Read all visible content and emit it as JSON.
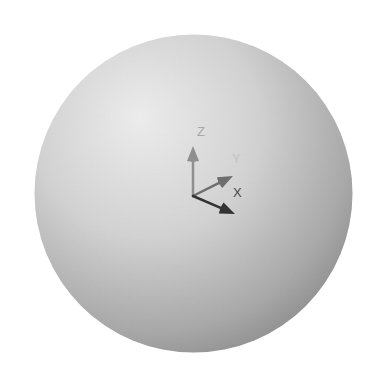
{
  "scene": {
    "background": "#ffffff",
    "sphere": {
      "cx": 193.5,
      "cy": 193.5,
      "r": 159,
      "highlight_color": "#ececec",
      "mid_color": "#cfcfcf",
      "shadow_color": "#8c8c8c"
    },
    "triad": {
      "origin": [
        193,
        196
      ],
      "axes": [
        {
          "name": "Z",
          "label": "Z",
          "tip": [
            193,
            146
          ],
          "color": "#8f8f8f",
          "label_color": "#a8a8a8",
          "label_pos": [
            197,
            136
          ]
        },
        {
          "name": "Y",
          "label": "Y",
          "tip": [
            233,
            176
          ],
          "color": "#6e6e6e",
          "label_color": "#c2c2c2",
          "label_pos": [
            232,
            163
          ]
        },
        {
          "name": "X",
          "label": "X",
          "tip": [
            235,
            214
          ],
          "color": "#333333",
          "label_color": "#4a4a4a",
          "label_pos": [
            233,
            197
          ]
        }
      ]
    }
  }
}
